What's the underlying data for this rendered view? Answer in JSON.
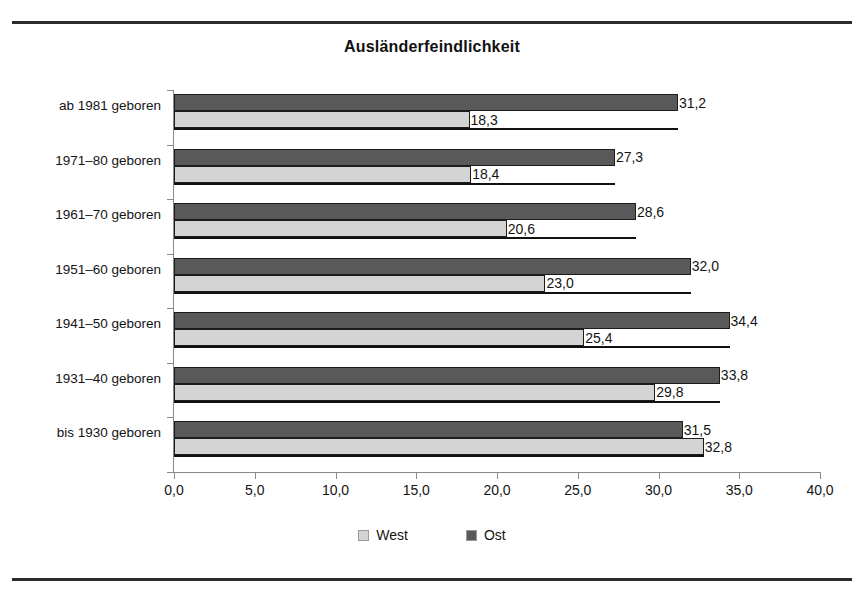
{
  "chart_data": {
    "type": "bar",
    "orientation": "horizontal",
    "title": "Ausländerfeindlichkeit",
    "xlabel": "",
    "ylabel": "",
    "xlim": [
      0.0,
      40.0
    ],
    "xticks": [
      "0,0",
      "5,0",
      "10,0",
      "15,0",
      "20,0",
      "25,0",
      "30,0",
      "35,0",
      "40,0"
    ],
    "xtick_values": [
      0,
      5,
      10,
      15,
      20,
      25,
      30,
      35,
      40
    ],
    "grid": false,
    "legend_position": "bottom",
    "categories": [
      "ab 1981 geboren",
      "1971–80 geboren",
      "1961–70 geboren",
      "1951–60 geboren",
      "1941–50 geboren",
      "1931–40 geboren",
      "bis 1930 geboren"
    ],
    "series": [
      {
        "name": "Ost",
        "color": "#595959",
        "values": [
          31.2,
          27.3,
          28.6,
          32.0,
          34.4,
          33.8,
          31.5
        ],
        "labels": [
          "31,2",
          "27,3",
          "28,6",
          "32,0",
          "34,4",
          "33,8",
          "31,5"
        ]
      },
      {
        "name": "West",
        "color": "#d4d4d4",
        "values": [
          18.3,
          18.4,
          20.6,
          23.0,
          25.4,
          29.8,
          32.8
        ],
        "labels": [
          "18,3",
          "18,4",
          "20,6",
          "23,0",
          "25,4",
          "29,8",
          "32,8"
        ]
      }
    ]
  },
  "legend": {
    "items": [
      {
        "label": "West",
        "color": "#d4d4d4"
      },
      {
        "label": "Ost",
        "color": "#595959"
      }
    ]
  }
}
